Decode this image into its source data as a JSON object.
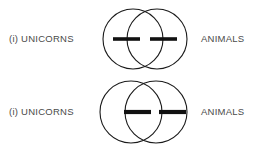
{
  "figure": {
    "background_color": "#ffffff",
    "stroke_color": "#1a1a1a",
    "dash_color": "#111111",
    "label_color": "#4a4a4a"
  },
  "diagrams": [
    {
      "index": "top",
      "left_label": "(i) UNICORNS",
      "right_label": "ANIMALS",
      "circles": [
        {
          "cx": 38,
          "cy": 34,
          "r": 30
        },
        {
          "cx": 62,
          "cy": 34,
          "r": 30
        }
      ],
      "dashes": [
        {
          "x1": 18,
          "x2": 45,
          "y": 34
        },
        {
          "x1": 55,
          "x2": 82,
          "y": 34
        }
      ]
    },
    {
      "index": "bottom",
      "left_label": "(i) UNICORNS",
      "right_label": "ANIMALS",
      "circles": [
        {
          "cx": 35,
          "cy": 35,
          "r": 31
        },
        {
          "cx": 60,
          "cy": 35,
          "r": 31
        }
      ],
      "dashes": [
        {
          "x1": 27,
          "x2": 55,
          "y": 35
        },
        {
          "x1": 63,
          "x2": 90,
          "y": 35
        }
      ]
    }
  ]
}
